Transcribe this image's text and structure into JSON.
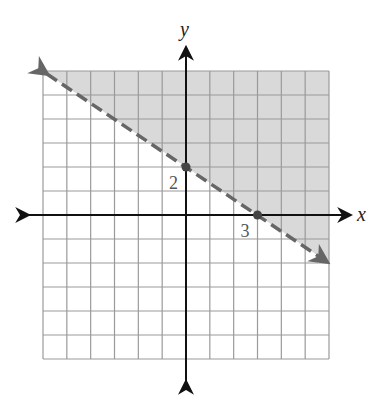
{
  "chart_data": {
    "type": "line",
    "title": "",
    "xlabel": "x",
    "ylabel": "y",
    "xlim": [
      -6,
      6
    ],
    "ylim": [
      -6,
      6
    ],
    "grid": true,
    "grid_step": 1,
    "boundary_line": {
      "equation": "y = -2/3 x + 2",
      "style": "dashed",
      "from": [
        -6,
        6
      ],
      "to": [
        6,
        -2
      ]
    },
    "shaded_region": "above line (y > -2/3 x + 2)",
    "points": [
      {
        "x": 0,
        "y": 2,
        "label": "2"
      },
      {
        "x": 3,
        "y": 0,
        "label": "3"
      }
    ],
    "colors": {
      "shade": "#d9d9d9",
      "grid": "#9a9a9a",
      "line": "#666666",
      "axis": "#111111"
    }
  },
  "labels": {
    "x_axis": "x",
    "y_axis": "y",
    "y_intercept": "2",
    "x_intercept": "3"
  }
}
